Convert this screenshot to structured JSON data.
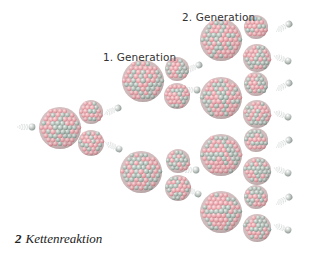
{
  "figure": {
    "caption_number": "2",
    "caption_text": "Kettenreaktion",
    "labels": {
      "generation1": "1. Generation",
      "generation2": "2. Generation"
    },
    "colors": {
      "background": "#ffffff",
      "proton": "#e8a8ad",
      "neutron_in_nucleus": "#a9b8b0",
      "free_neutron": "#b5bdb9",
      "motion_lines": "#c9cfcc",
      "text": "#333333"
    }
  },
  "diagram": {
    "type": "nuclear-chain-reaction",
    "nuclei": [
      {
        "id": "initial",
        "x": 60,
        "y": 128,
        "r": 21,
        "kind": "heavy"
      },
      {
        "id": "frag0a",
        "x": 91,
        "y": 112,
        "r": 12,
        "kind": "fragment"
      },
      {
        "id": "frag0b",
        "x": 91,
        "y": 143,
        "r": 13,
        "kind": "fragment"
      },
      {
        "id": "gen1a",
        "x": 143,
        "y": 81,
        "r": 21,
        "kind": "heavy"
      },
      {
        "id": "frag1a1",
        "x": 177,
        "y": 69,
        "r": 12,
        "kind": "fragment"
      },
      {
        "id": "frag1a2",
        "x": 177,
        "y": 96,
        "r": 13,
        "kind": "fragment"
      },
      {
        "id": "gen1b",
        "x": 141,
        "y": 172,
        "r": 21,
        "kind": "heavy"
      },
      {
        "id": "frag1b1",
        "x": 178,
        "y": 161,
        "r": 12,
        "kind": "fragment"
      },
      {
        "id": "frag1b2",
        "x": 178,
        "y": 188,
        "r": 13,
        "kind": "fragment"
      },
      {
        "id": "gen2a",
        "x": 221,
        "y": 40,
        "r": 21,
        "kind": "heavy"
      },
      {
        "id": "gen2b",
        "x": 221,
        "y": 98,
        "r": 21,
        "kind": "heavy"
      },
      {
        "id": "gen2c",
        "x": 221,
        "y": 155,
        "r": 21,
        "kind": "heavy"
      },
      {
        "id": "gen2d",
        "x": 221,
        "y": 212,
        "r": 21,
        "kind": "heavy"
      },
      {
        "id": "frag2a1",
        "x": 256,
        "y": 27,
        "r": 12,
        "kind": "fragment"
      },
      {
        "id": "frag2a2",
        "x": 257,
        "y": 58,
        "r": 14,
        "kind": "fragment"
      },
      {
        "id": "frag2b1",
        "x": 256,
        "y": 84,
        "r": 12,
        "kind": "fragment"
      },
      {
        "id": "frag2b2",
        "x": 257,
        "y": 114,
        "r": 14,
        "kind": "fragment"
      },
      {
        "id": "frag2c1",
        "x": 256,
        "y": 140,
        "r": 12,
        "kind": "fragment"
      },
      {
        "id": "frag2c2",
        "x": 257,
        "y": 171,
        "r": 14,
        "kind": "fragment"
      },
      {
        "id": "frag2d1",
        "x": 256,
        "y": 197,
        "r": 12,
        "kind": "fragment"
      },
      {
        "id": "frag2d2",
        "x": 257,
        "y": 228,
        "r": 14,
        "kind": "fragment"
      }
    ],
    "neutrons": [
      {
        "x": 32,
        "y": 127,
        "dir": 0
      },
      {
        "x": 118,
        "y": 108,
        "dir": -25
      },
      {
        "x": 119,
        "y": 149,
        "dir": 25
      },
      {
        "x": 199,
        "y": 65,
        "dir": -25
      },
      {
        "x": 197,
        "y": 90,
        "dir": 0
      },
      {
        "x": 196,
        "y": 170,
        "dir": 0
      },
      {
        "x": 198,
        "y": 194,
        "dir": 25
      },
      {
        "x": 289,
        "y": 24,
        "dir": -30
      },
      {
        "x": 288,
        "y": 61,
        "dir": 20
      },
      {
        "x": 289,
        "y": 83,
        "dir": -30
      },
      {
        "x": 288,
        "y": 117,
        "dir": 20
      },
      {
        "x": 289,
        "y": 140,
        "dir": -30
      },
      {
        "x": 288,
        "y": 173,
        "dir": 20
      },
      {
        "x": 289,
        "y": 197,
        "dir": -30
      },
      {
        "x": 288,
        "y": 230,
        "dir": 20
      }
    ]
  }
}
